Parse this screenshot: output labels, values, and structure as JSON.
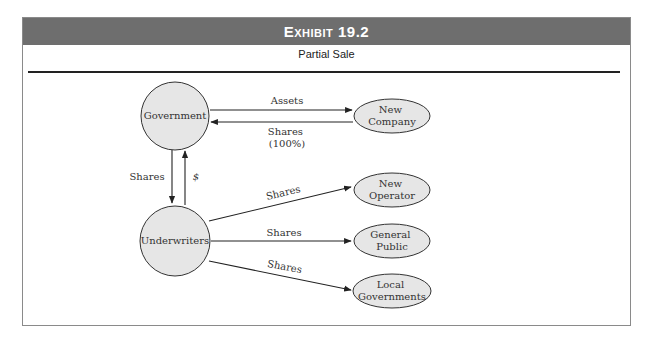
{
  "exhibit": {
    "title": "Exhibit 19.2",
    "subtitle": "Partial Sale"
  },
  "nodes": {
    "government": "Government",
    "underwriters": "Underwriters",
    "new_company": [
      "New",
      "Company"
    ],
    "new_operator": [
      "New",
      "Operator"
    ],
    "general_public": [
      "General",
      "Public"
    ],
    "local_governments": [
      "Local",
      "Governments"
    ]
  },
  "edges": {
    "gov_to_newco": "Assets",
    "newco_to_gov": [
      "Shares",
      "(100%)"
    ],
    "gov_to_under": "Shares",
    "under_to_gov": "$",
    "under_to_operator": "Shares",
    "under_to_public": "Shares",
    "under_to_local": "Shares"
  },
  "colors": {
    "header_bg": "#6e6e6e",
    "node_fill": "#e6e6e6",
    "stroke": "#333333"
  }
}
